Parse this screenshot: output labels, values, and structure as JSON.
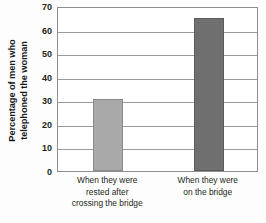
{
  "chart_data": {
    "type": "bar",
    "title": "",
    "xlabel": "",
    "ylabel": "Percentage of men who telephoned the woman",
    "ylabel_lines": [
      "Percentage of men who",
      "telephoned the woman"
    ],
    "categories": [
      "When they were rested after crossing the bridge",
      "When they were on the bridge"
    ],
    "category_lines": [
      [
        "When they were",
        "rested after",
        "crossing the bridge"
      ],
      [
        "When they were",
        "on the bridge"
      ]
    ],
    "values": [
      30.5,
      65
    ],
    "ylim": [
      0,
      70
    ],
    "ytick_labels": [
      "0",
      "10",
      "20",
      "30",
      "40",
      "50",
      "60",
      "70"
    ],
    "ytick_values": [
      0,
      10,
      20,
      30,
      40,
      50,
      60,
      70
    ],
    "grid": true,
    "legend": "none",
    "bar_colors": [
      "#a9a9a9",
      "#6f6f6f"
    ],
    "bar_border_colors": [
      "#8a8a8a",
      "#5c5c5c"
    ],
    "gridline_color": "#9a9a9a",
    "axis_color": "#8e8e8e",
    "background_color": "#fdfdfd",
    "plot_background_color": "#ffffff"
  }
}
